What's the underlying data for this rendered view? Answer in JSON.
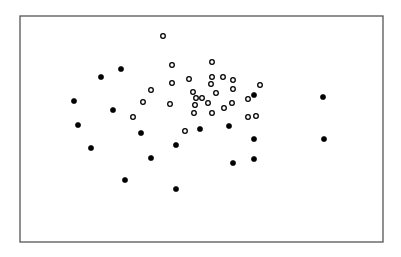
{
  "chart_data": {
    "type": "scatter",
    "title": "",
    "xlabel": "",
    "ylabel": "",
    "axes": "none (bare frame, no ticks or labels)",
    "grid": false,
    "legend": null,
    "frame": {
      "x0": 20,
      "y0": 16,
      "x1": 383,
      "y1": 242
    },
    "coordinate_space": "pixel coordinates within 401x257 image (no axis scale shown)",
    "series": [
      {
        "name": "filled",
        "marker": "filled-circle",
        "color": "#000000",
        "points": [
          [
            101,
            77
          ],
          [
            121,
            69
          ],
          [
            74,
            101
          ],
          [
            113,
            110
          ],
          [
            78,
            125
          ],
          [
            91,
            148
          ],
          [
            141,
            133
          ],
          [
            125,
            180
          ],
          [
            151,
            158
          ],
          [
            176,
            145
          ],
          [
            200,
            129
          ],
          [
            229,
            126
          ],
          [
            176,
            189
          ],
          [
            254,
            95
          ],
          [
            323,
            97
          ],
          [
            254,
            139
          ],
          [
            254,
            159
          ],
          [
            233,
            163
          ],
          [
            324,
            139
          ]
        ]
      },
      {
        "name": "open",
        "marker": "open-circle",
        "color": "#000000",
        "points": [
          [
            163,
            36
          ],
          [
            172,
            65
          ],
          [
            172,
            83
          ],
          [
            151,
            90
          ],
          [
            143,
            102
          ],
          [
            133,
            117
          ],
          [
            170,
            104
          ],
          [
            193,
            92
          ],
          [
            189,
            79
          ],
          [
            196,
            98
          ],
          [
            195,
            105
          ],
          [
            194,
            113
          ],
          [
            212,
            62
          ],
          [
            212,
            77
          ],
          [
            223,
            77
          ],
          [
            233,
            80
          ],
          [
            211,
            84
          ],
          [
            202,
            98
          ],
          [
            216,
            93
          ],
          [
            233,
            89
          ],
          [
            232,
            103
          ],
          [
            208,
            103
          ],
          [
            224,
            108
          ],
          [
            248,
            99
          ],
          [
            260,
            85
          ],
          [
            248,
            117
          ],
          [
            256,
            116
          ],
          [
            185,
            131
          ],
          [
            212,
            113
          ]
        ]
      }
    ]
  }
}
